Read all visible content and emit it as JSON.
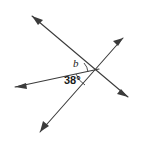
{
  "figure": {
    "type": "geometry-diagram",
    "width": 144,
    "height": 142,
    "background_color": "#ffffff",
    "stroke_color": "#3b3b3b",
    "text_color": "#1a1a1a"
  },
  "labels": {
    "angle_b": "b",
    "angle_measure": "38°"
  },
  "vertex": {
    "name": "intersection-point",
    "x": 96,
    "y": 71
  },
  "lines": [
    {
      "name": "line-upperleft-to-lowerright",
      "x1": 32,
      "y1": 16,
      "x2": 128,
      "y2": 97,
      "arrow_start": true,
      "arrow_end": true
    },
    {
      "name": "line-lowerleft-to-upperright",
      "x1": 40,
      "y1": 132,
      "x2": 123,
      "y2": 38,
      "arrow_start": true,
      "arrow_end": true
    },
    {
      "name": "ray-left-horizontal",
      "x1": 15,
      "y1": 87,
      "x2": 99,
      "y2": 69,
      "arrow_start": true,
      "arrow_end": false
    }
  ],
  "arcs": [
    {
      "name": "arc-angle-b",
      "path": "M 84 66 A 13 13 0 0 1 87 72"
    },
    {
      "name": "arc-angle-38",
      "path": "M 78 73 A 19 19 0 0 0 85 83"
    }
  ],
  "arrowheads": [
    {
      "name": "arrowhead-upper-left",
      "points": "32,16 42,19 38,24"
    },
    {
      "name": "arrowhead-lower-right",
      "points": "128,97 118,95 121,90"
    },
    {
      "name": "arrowhead-upper-right",
      "points": "123,38 114,41 118,46"
    },
    {
      "name": "arrowhead-bottom-left",
      "points": "40,132 43,122 48,126"
    },
    {
      "name": "arrowhead-left",
      "points": "15,87 25,84 26,89"
    }
  ]
}
